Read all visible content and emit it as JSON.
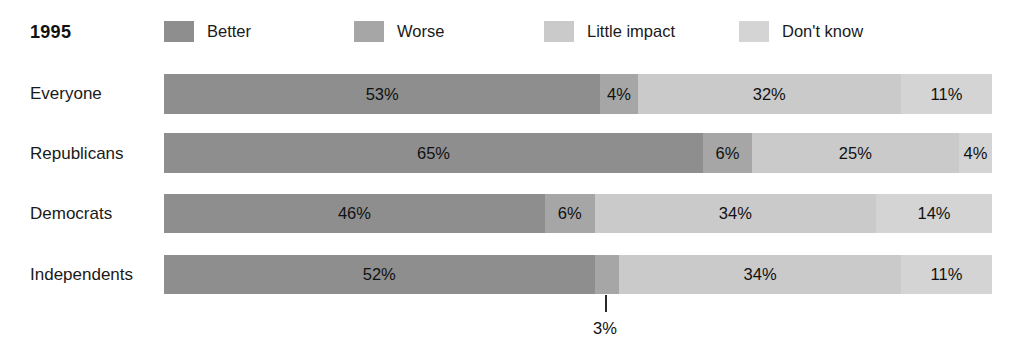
{
  "header": {
    "year": "1995"
  },
  "legend": {
    "items": [
      {
        "label": "Better",
        "color": "#8e8e8e",
        "x": 0
      },
      {
        "label": "Worse",
        "color": "#a6a6a6",
        "x": 190
      },
      {
        "label": "Little impact",
        "color": "#cacaca",
        "x": 380
      },
      {
        "label": "Don't know",
        "color": "#d4d4d4",
        "x": 575
      }
    ]
  },
  "chart_data": {
    "type": "bar",
    "subtype": "stacked-horizontal-100",
    "title": "1995",
    "xlabel": "",
    "ylabel": "",
    "xlim": [
      0,
      100
    ],
    "grid": false,
    "legend_position": "top",
    "categories": [
      "Everyone",
      "Republicans",
      "Democrats",
      "Independents"
    ],
    "series": [
      {
        "name": "Better",
        "color": "#8e8e8e",
        "values": [
          53,
          65,
          46,
          52
        ]
      },
      {
        "name": "Worse",
        "color": "#a6a6a6",
        "values": [
          4,
          6,
          6,
          3
        ]
      },
      {
        "name": "Little impact",
        "color": "#cacaca",
        "values": [
          32,
          25,
          34,
          34
        ]
      },
      {
        "name": "Don't know",
        "color": "#d4d4d4",
        "values": [
          11,
          4,
          14,
          11
        ]
      }
    ],
    "annotations": [
      {
        "text": "3%",
        "for_row": "Independents",
        "for_series": "Worse",
        "kind": "leader-line-below"
      }
    ]
  },
  "rows": [
    {
      "label": "Everyone",
      "label_y": 85,
      "bar_y": 74,
      "bar_h": 40,
      "segments": [
        {
          "name": "Better",
          "value": "53%",
          "pct": 52.7,
          "color": "#8e8e8e",
          "show": true
        },
        {
          "name": "Worse",
          "value": "4%",
          "pct": 4.5,
          "color": "#a6a6a6",
          "show": true
        },
        {
          "name": "Little impact",
          "value": "32%",
          "pct": 31.8,
          "color": "#cacaca",
          "show": true
        },
        {
          "name": "Don't know",
          "value": "11%",
          "pct": 11.0,
          "color": "#d4d4d4",
          "show": true
        }
      ]
    },
    {
      "label": "Republicans",
      "label_y": 145,
      "bar_y": 133,
      "bar_h": 40,
      "segments": [
        {
          "name": "Better",
          "value": "65%",
          "pct": 65.1,
          "color": "#8e8e8e",
          "show": true
        },
        {
          "name": "Worse",
          "value": "6%",
          "pct": 5.9,
          "color": "#a6a6a6",
          "show": true
        },
        {
          "name": "Little impact",
          "value": "25%",
          "pct": 25.0,
          "color": "#cacaca",
          "show": true
        },
        {
          "name": "Don't know",
          "value": "4%",
          "pct": 4.0,
          "color": "#d4d4d4",
          "show": true
        }
      ]
    },
    {
      "label": "Democrats",
      "label_y": 205,
      "bar_y": 194,
      "bar_h": 39,
      "segments": [
        {
          "name": "Better",
          "value": "46%",
          "pct": 46.0,
          "color": "#8e8e8e",
          "show": true
        },
        {
          "name": "Worse",
          "value": "6%",
          "pct": 6.0,
          "color": "#a6a6a6",
          "show": true
        },
        {
          "name": "Little impact",
          "value": "34%",
          "pct": 34.0,
          "color": "#cacaca",
          "show": true
        },
        {
          "name": "Don't know",
          "value": "14%",
          "pct": 14.0,
          "color": "#d4d4d4",
          "show": true
        }
      ]
    },
    {
      "label": "Independents",
      "label_y": 266,
      "bar_y": 255,
      "bar_h": 39,
      "segments": [
        {
          "name": "Better",
          "value": "52%",
          "pct": 52.0,
          "color": "#8e8e8e",
          "show": true
        },
        {
          "name": "Worse",
          "value": "3%",
          "pct": 3.0,
          "color": "#a6a6a6",
          "show": false
        },
        {
          "name": "Little impact",
          "value": "34%",
          "pct": 34.0,
          "color": "#cacaca",
          "show": true
        },
        {
          "name": "Don't know",
          "value": "11%",
          "pct": 11.0,
          "color": "#d4d4d4",
          "show": true
        }
      ]
    }
  ],
  "callout": {
    "value": "3%",
    "line_x": 605,
    "line_top": 295,
    "line_height": 17,
    "text_x": 605,
    "text_y": 320
  }
}
